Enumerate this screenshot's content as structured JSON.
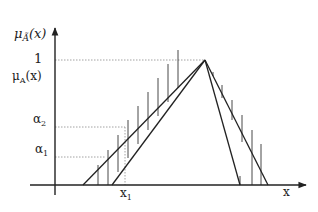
{
  "diagram": {
    "y_axis_label": "μ",
    "y_axis_label_sub": "Ã",
    "y_axis_label_arg": "(x)",
    "x_axis_label": "x",
    "tick_one": "1",
    "mu_a_label": "μ",
    "mu_a_sub": "A",
    "mu_a_arg": "(x)",
    "alpha2_label": "α",
    "alpha2_sub": "2",
    "alpha1_label": "α",
    "alpha1_sub": "1",
    "x1_label": "x",
    "x1_sub": "1"
  },
  "geometry": {
    "origin": [
      55,
      185
    ],
    "peak": [
      205,
      60
    ],
    "left_outer_base": 83,
    "left_inner_base": 112,
    "right_inner_base": 240,
    "right_outer_base": 268,
    "y_one": 60,
    "y_alpha2": 127,
    "y_alpha1": 157,
    "x1": 125
  },
  "colors": {
    "line": "#222222",
    "guide": "#8a8a8a"
  }
}
